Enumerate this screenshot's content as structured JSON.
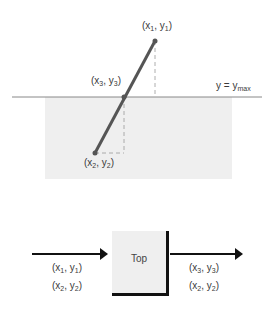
{
  "top_diagram": {
    "boundary_label": {
      "lhs": "y",
      "eq": "=",
      "rhs": "y",
      "rhs_sub": "max"
    },
    "points": [
      {
        "id": "p1",
        "label_x": "x",
        "label_x_sub": "1",
        "label_y": "y",
        "label_y_sub": "1"
      },
      {
        "id": "p3",
        "label_x": "x",
        "label_x_sub": "3",
        "label_y": "y",
        "label_y_sub": "3"
      },
      {
        "id": "p2",
        "label_x": "x",
        "label_x_sub": "2",
        "label_y": "y",
        "label_y_sub": "2"
      }
    ],
    "colors": {
      "line": "#555555",
      "shade": "#efefef",
      "boundary": "#888888",
      "dashed": "#999999"
    }
  },
  "pipeline": {
    "box_label": "Top",
    "inputs": [
      {
        "x": "x",
        "x_sub": "1",
        "y": "y",
        "y_sub": "1"
      },
      {
        "x": "x",
        "x_sub": "2",
        "y": "y",
        "y_sub": "2"
      }
    ],
    "outputs": [
      {
        "x": "x",
        "x_sub": "3",
        "y": "y",
        "y_sub": "3"
      },
      {
        "x": "x",
        "x_sub": "2",
        "y": "y",
        "y_sub": "2"
      }
    ]
  }
}
